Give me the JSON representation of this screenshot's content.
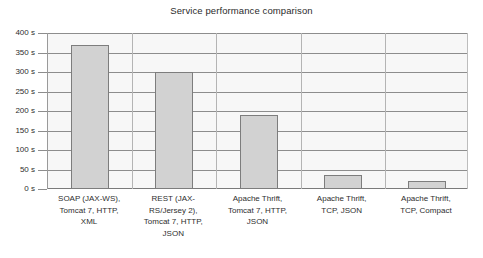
{
  "chart_data": {
    "type": "bar",
    "title": "Service performance comparison",
    "xlabel": "",
    "ylabel": "",
    "unit": "s",
    "categories": [
      "SOAP (JAX-WS), Tomcat 7, HTTP, XML",
      "REST (JAX-RS/Jersey 2), Tomcat 7, HTTP, JSON",
      "Apache Thrift, Tomcat 7, HTTP, JSON",
      "Apache Thrift, TCP, JSON",
      "Apache Thrift, TCP, Compact"
    ],
    "category_lines": [
      [
        "SOAP (JAX-WS),",
        "Tomcat 7, HTTP,",
        "XML"
      ],
      [
        "REST (JAX-",
        "RS/Jersey 2),",
        "Tomcat 7, HTTP,",
        "JSON"
      ],
      [
        "Apache Thrift,",
        "Tomcat 7, HTTP,",
        "JSON"
      ],
      [
        "Apache Thrift,",
        "TCP, JSON"
      ],
      [
        "Apache Thrift,",
        "TCP, Compact"
      ]
    ],
    "values": [
      370,
      300,
      190,
      35,
      20
    ],
    "ylim": [
      0,
      400
    ],
    "ytick_values": [
      400,
      350,
      300,
      250,
      200,
      150,
      100,
      50,
      0
    ],
    "ytick_labels": [
      "400 s",
      "350 s",
      "300 s",
      "250 s",
      "200 s",
      "150 s",
      "100 s",
      "50 s",
      "0 s"
    ],
    "grid": true,
    "legend": "none",
    "colors": {
      "bar_fill": "#d2d2d2",
      "bar_border": "#7d7d7d",
      "plot_background": "#f7f7f7",
      "gridline": "#8d8d8d",
      "text": "#2e2e2e"
    }
  }
}
